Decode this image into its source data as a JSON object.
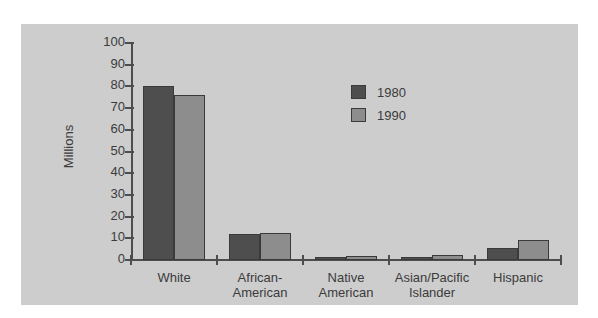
{
  "chart_data": {
    "type": "bar",
    "title": "",
    "xlabel": "",
    "ylabel": "Millions",
    "ylim": [
      0,
      100
    ],
    "yticks": [
      0,
      10,
      20,
      30,
      40,
      50,
      60,
      70,
      80,
      90,
      100
    ],
    "ytick_labels": [
      "0",
      "10",
      "20",
      "30",
      "40",
      "50",
      "60",
      "70",
      "80",
      "90",
      "100"
    ],
    "grid": false,
    "legend_position": "upper-center-right",
    "categories": [
      "White",
      "African-American",
      "Native American",
      "Asian/Pacific Islander",
      "Hispanic"
    ],
    "category_lines": [
      [
        "White"
      ],
      [
        "African-",
        "American"
      ],
      [
        "Native",
        "American"
      ],
      [
        "Asian/Pacific",
        "Islander"
      ],
      [
        "Hispanic"
      ]
    ],
    "series": [
      {
        "name": "1980",
        "color": "#4e4e4e",
        "values": [
          80,
          12,
          1.4,
          1.5,
          5.5
        ]
      },
      {
        "name": "1990",
        "color": "#8d8d8d",
        "values": [
          76,
          12.5,
          2,
          2.5,
          9
        ]
      }
    ]
  },
  "figure": {
    "background": "#cdcdcd",
    "page_background": "#ffffff",
    "axis_color": "#4d4d4d",
    "text_color": "#3b3b3b"
  }
}
